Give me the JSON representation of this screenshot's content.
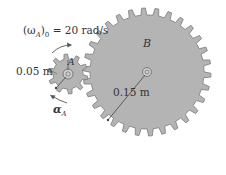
{
  "diagram": {
    "colors": {
      "gear_fill": "#b4b4b4",
      "gear_stroke": "#7a7a7a",
      "text": "#333333",
      "background": "#ffffff"
    },
    "gear_A": {
      "label": "A",
      "radius_label": "0.05 m",
      "center": [
        68,
        74
      ],
      "outer_radius": 20,
      "root_radius": 15,
      "teeth": 10
    },
    "gear_B": {
      "label": "B",
      "radius_label": "0.15 m",
      "center": [
        147,
        72
      ],
      "outer_radius": 64,
      "root_radius": 57,
      "teeth": 30
    },
    "annotations": {
      "initial_angular_velocity": "(ωA)0 = 20 rad/s",
      "omega_symbol": "(ω",
      "omega_sub": "A",
      "omega_rest": ")",
      "omega_sub0": "0",
      "omega_value": " = 20 rad/s",
      "angular_acceleration_symbol": "α",
      "angular_acceleration_sub": "A"
    }
  }
}
